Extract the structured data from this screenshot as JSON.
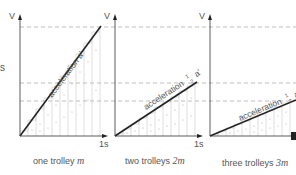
{
  "figure": {
    "edge_label_left": "s",
    "panels": [
      {
        "id": "one-trolley",
        "y_axis_label": "V",
        "x_end_label": "1s",
        "line_label": "acceleration a'",
        "caption_text": "one trolley ",
        "caption_mass": "m",
        "acceleration_fraction": "1",
        "final_velocity_level": "top"
      },
      {
        "id": "two-trolleys",
        "y_axis_label": "V",
        "x_end_label": "1s",
        "line_label_prefix": "acceleration",
        "fraction_num": "1",
        "fraction_den": "2",
        "line_label_suffix": "a'",
        "caption_text": "two trolleys ",
        "caption_mass": "2m",
        "acceleration_fraction": "1/2",
        "final_velocity_level": "middle"
      },
      {
        "id": "three-trolleys",
        "y_axis_label": "V",
        "x_end_label": "1s",
        "line_label_prefix": "acceleration",
        "fraction_num": "1",
        "fraction_den": "3",
        "line_label_suffix": "a'",
        "caption_text": "three trolleys ",
        "caption_mass": "3m",
        "acceleration_fraction": "1/3",
        "final_velocity_level": "lower"
      }
    ],
    "colors": {
      "line": "#222222",
      "axis": "#333333",
      "dashed": "#999999",
      "grid": "#bbbbbb",
      "text": "#555555"
    }
  }
}
